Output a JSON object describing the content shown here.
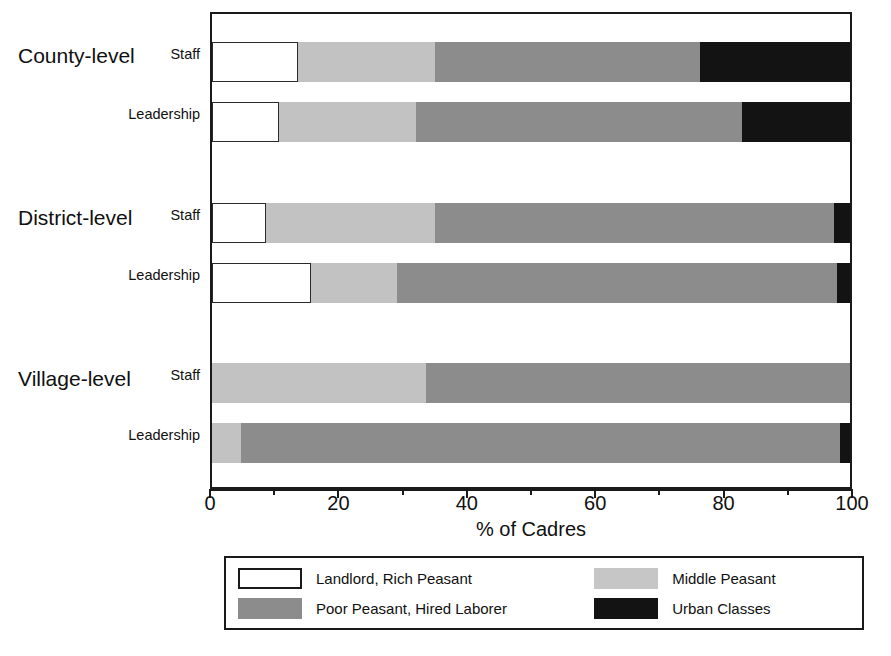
{
  "chart_data": {
    "type": "bar",
    "orientation": "horizontal",
    "stacked": true,
    "stacked_percent": true,
    "title": "",
    "xlabel": "% of Cadres",
    "ylabel": "",
    "xlim": [
      0,
      100
    ],
    "xticks": [
      0,
      20,
      40,
      60,
      80,
      100
    ],
    "xtick_labels": [
      "0",
      "20",
      "40",
      "60",
      "80",
      "100"
    ],
    "grid": false,
    "legend_position": "bottom",
    "groups": [
      "County-level",
      "District-level",
      "Village-level"
    ],
    "categories": [
      "County-level Staff",
      "County-level Leadership",
      "District-level Staff",
      "District-level Leadership",
      "Village-level Staff",
      "Village-level Leadership"
    ],
    "series": [
      {
        "name": "Landlord, Rich Peasant",
        "color": "#ffffff",
        "values": [
          13.5,
          10.5,
          8.5,
          15.5,
          0,
          0
        ]
      },
      {
        "name": "Middle Peasant",
        "color": "#c2c2c2",
        "values": [
          21.5,
          21.5,
          26.5,
          13.5,
          33.5,
          4.5
        ]
      },
      {
        "name": "Poor Peasant, Hired Laborer",
        "color": "#8c8c8c",
        "values": [
          41.5,
          51,
          62.5,
          69,
          66.5,
          94
        ]
      },
      {
        "name": "Urban Classes",
        "color": "#131313",
        "values": [
          23.5,
          17,
          2.5,
          2,
          0,
          1.5
        ]
      }
    ]
  },
  "axis": {
    "x_title": "% of Cadres",
    "tick_labels": [
      "0",
      "20",
      "40",
      "60",
      "80",
      "100"
    ]
  },
  "groups": [
    {
      "label": "County-level",
      "rows": [
        {
          "label": "Staff"
        },
        {
          "label": "Leadership"
        }
      ]
    },
    {
      "label": "District-level",
      "rows": [
        {
          "label": "Staff"
        },
        {
          "label": "Leadership"
        }
      ]
    },
    {
      "label": "Village-level",
      "rows": [
        {
          "label": "Staff"
        },
        {
          "label": "Leadership"
        }
      ]
    }
  ],
  "legend": {
    "items": [
      {
        "label": "Landlord, Rich Peasant",
        "color": "#ffffff"
      },
      {
        "label": "Middle Peasant",
        "color": "#c6c6c6"
      },
      {
        "label": "Poor Peasant, Hired Laborer",
        "color": "#8c8c8c"
      },
      {
        "label": "Urban Classes",
        "color": "#131313"
      }
    ]
  }
}
